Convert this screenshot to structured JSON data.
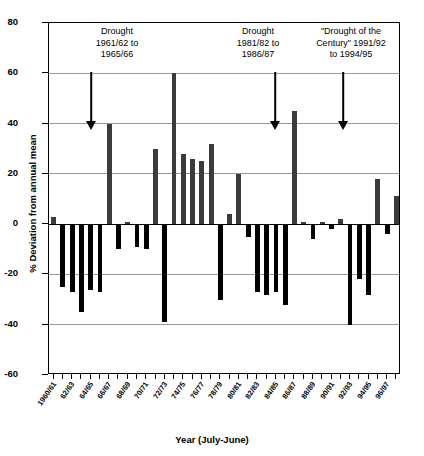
{
  "chart_data": {
    "type": "bar",
    "title": "",
    "xlabel": "Year (July-June)",
    "ylabel": "% Deviation from annual mean",
    "ylim": [
      -60,
      80
    ],
    "yticks": [
      80,
      60,
      40,
      20,
      0,
      -20,
      -40,
      -60
    ],
    "grid": true,
    "legend": "none",
    "bar_color": "#3b3b3b",
    "categories": [
      "1960/61",
      "61/62",
      "62/63",
      "63/64",
      "64/65",
      "65/66",
      "66/67",
      "67/68",
      "68/69",
      "69/70",
      "70/71",
      "71/72",
      "72/73",
      "73/74",
      "74/75",
      "75/76",
      "76/77",
      "77/78",
      "78/79",
      "79/80",
      "80/81",
      "81/82",
      "82/83",
      "83/84",
      "84/85",
      "85/86",
      "86/87",
      "87/88",
      "88/89",
      "89/90",
      "90/91",
      "91/92",
      "92/93",
      "93/94",
      "94/95",
      "95/96",
      "96/97",
      "97/98"
    ],
    "values": [
      3,
      -25,
      -27,
      -35,
      -26,
      -27,
      40,
      -10,
      1,
      -9,
      -10,
      30,
      -39,
      60,
      28,
      26,
      25,
      32,
      -30,
      4,
      20,
      -5,
      -27,
      -28,
      -27,
      -32,
      45,
      1,
      -6,
      1,
      -2,
      2,
      -40,
      -22,
      -28,
      18,
      -4,
      11
    ],
    "xtick_labels": [
      "1960/61",
      "62/63",
      "64/65",
      "66/67",
      "68/69",
      "70/71",
      "72/73",
      "74/75",
      "76/77",
      "78/79",
      "80/81",
      "82/83",
      "84/85",
      "86/87",
      "88/89",
      "90/91",
      "92/93",
      "94/95",
      "96/97"
    ],
    "annotations": [
      {
        "id": "drought-1",
        "text": "Drought\n1961/62 to\n1965/66",
        "arrow_to_year": "1963/64"
      },
      {
        "id": "drought-2",
        "text": "Drought\n1981/82 to\n1986/87",
        "arrow_to_year": "1983/84"
      },
      {
        "id": "drought-3",
        "text": "\"Drought of the\nCentury\" 1991/92\nto 1994/95",
        "arrow_to_year": "1992/93"
      }
    ]
  }
}
